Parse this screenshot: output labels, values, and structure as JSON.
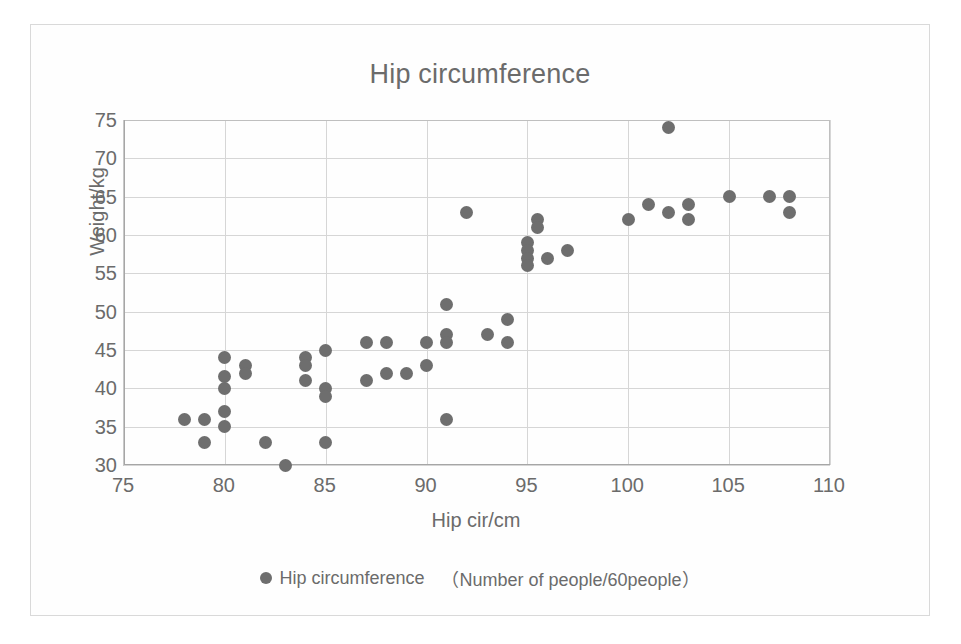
{
  "chart_data": {
    "type": "scatter",
    "title": "Hip circumference",
    "xlabel": "Hip cir/cm",
    "ylabel": "Weight/kg",
    "xlim": [
      75,
      110
    ],
    "ylim": [
      30,
      75
    ],
    "xticks": [
      75,
      80,
      85,
      90,
      95,
      100,
      105,
      110
    ],
    "yticks": [
      30,
      35,
      40,
      45,
      50,
      55,
      60,
      65,
      70,
      75
    ],
    "grid": true,
    "legend_position": "bottom",
    "marker_color": "#6e6e6e",
    "series": [
      {
        "name": "Hip circumference",
        "sublabel": "（Number of people/60people）",
        "points": [
          [
            78,
            36
          ],
          [
            79,
            36
          ],
          [
            79,
            33
          ],
          [
            80,
            44
          ],
          [
            80,
            41.5
          ],
          [
            80,
            40
          ],
          [
            80,
            37
          ],
          [
            80,
            35
          ],
          [
            81,
            43
          ],
          [
            81,
            42
          ],
          [
            82,
            33
          ],
          [
            83,
            30
          ],
          [
            84,
            44
          ],
          [
            84,
            43
          ],
          [
            84,
            41
          ],
          [
            85,
            45
          ],
          [
            85,
            40
          ],
          [
            85,
            39
          ],
          [
            85,
            33
          ],
          [
            87,
            46
          ],
          [
            87,
            41
          ],
          [
            88,
            46
          ],
          [
            88,
            42
          ],
          [
            89,
            42
          ],
          [
            90,
            46
          ],
          [
            90,
            43
          ],
          [
            91,
            51
          ],
          [
            91,
            47
          ],
          [
            91,
            46
          ],
          [
            91,
            36
          ],
          [
            92,
            63
          ],
          [
            93,
            47
          ],
          [
            94,
            46
          ],
          [
            94,
            49
          ],
          [
            95,
            59
          ],
          [
            95,
            58
          ],
          [
            95,
            57
          ],
          [
            95,
            56
          ],
          [
            95.5,
            62
          ],
          [
            95.5,
            61
          ],
          [
            96,
            57
          ],
          [
            97,
            58
          ],
          [
            100,
            62
          ],
          [
            101,
            64
          ],
          [
            102,
            74
          ],
          [
            102,
            63
          ],
          [
            103,
            64
          ],
          [
            103,
            62
          ],
          [
            105,
            65
          ],
          [
            107,
            65
          ],
          [
            108,
            65
          ],
          [
            108,
            63
          ]
        ]
      }
    ]
  },
  "legend": {
    "label": "Hip circumference",
    "sublabel": "（Number of people/60people）"
  }
}
